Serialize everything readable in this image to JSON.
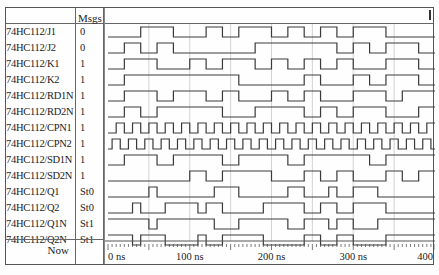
{
  "header": {
    "name_col": "",
    "msgs_col": "Msgs"
  },
  "signals": [
    {
      "name": "74HC112/J1",
      "value": "0",
      "init": 0,
      "toggles": [
        40,
        80,
        120,
        140,
        160,
        200,
        220,
        240,
        260,
        280,
        300,
        340
      ]
    },
    {
      "name": "74HC112/J2",
      "value": "0",
      "init": 0,
      "toggles": [
        20,
        40,
        60,
        80,
        180,
        280,
        300,
        320,
        340,
        380
      ]
    },
    {
      "name": "74HC112/K1",
      "value": "1",
      "init": 0,
      "toggles": [
        20,
        60,
        100,
        120,
        140,
        180,
        200,
        220,
        240,
        260,
        280,
        300,
        340,
        380
      ]
    },
    {
      "name": "74HC112/K2",
      "value": "1",
      "init": 0,
      "toggles": [
        20,
        160,
        240,
        260,
        300,
        320,
        340,
        380
      ]
    },
    {
      "name": "74HC112/RD1N",
      "value": "1",
      "init": 0,
      "toggles": [
        20,
        60,
        80,
        120,
        140,
        160,
        200,
        220,
        240,
        260,
        300,
        340,
        360
      ]
    },
    {
      "name": "74HC112/RD2N",
      "value": "1",
      "init": 0,
      "toggles": [
        20,
        40,
        60,
        140,
        180,
        240,
        260,
        280,
        300,
        340,
        380
      ]
    },
    {
      "name": "74HC112/CPN1",
      "value": "1",
      "init": 0,
      "clock": {
        "period": 20,
        "offset": 10
      }
    },
    {
      "name": "74HC112/CPN2",
      "value": "1",
      "init": 0,
      "clock": {
        "period": 20,
        "offset": 5
      }
    },
    {
      "name": "74HC112/SD1N",
      "value": "1",
      "init": 0,
      "toggles": [
        20,
        60,
        80,
        140,
        160,
        220,
        240,
        320,
        340
      ]
    },
    {
      "name": "74HC112/SD2N",
      "value": "1",
      "init": 0,
      "toggles": [
        100,
        120,
        140,
        200,
        240,
        260,
        280,
        300,
        340,
        360,
        380
      ]
    },
    {
      "name": "74HC112/Q1",
      "value": "St0",
      "init": 0,
      "toggles": [
        50,
        60,
        130,
        160,
        220,
        240,
        270,
        280,
        300,
        330
      ]
    },
    {
      "name": "74HC112/Q2",
      "value": "St0",
      "init": 0,
      "toggles": [
        30,
        40,
        70,
        110,
        120,
        140,
        190,
        240,
        260,
        280,
        300,
        340
      ]
    },
    {
      "name": "74HC112/Q1N",
      "value": "St1",
      "init": 1,
      "toggles": [
        50,
        60,
        130,
        160,
        220,
        240,
        270,
        280,
        300,
        330
      ]
    },
    {
      "name": "74HC112/Q2N",
      "value": "St1",
      "init": 1,
      "toggles": [
        30,
        40,
        70,
        110,
        120,
        140,
        190,
        240,
        260,
        280,
        300,
        340
      ]
    }
  ],
  "timeline": {
    "now_label": "Now",
    "start_ns": 0,
    "end_ns": 400,
    "major_ticks": [
      {
        "t": 0,
        "label": "0 ns"
      },
      {
        "t": 100,
        "label": "100 ns"
      },
      {
        "t": 200,
        "label": "200 ns"
      },
      {
        "t": 300,
        "label": "300 ns"
      },
      {
        "t": 400,
        "label": "400"
      }
    ],
    "grid_every_ns": 50
  },
  "colors": {
    "wave": "#3a3a3a",
    "grid": "#c8c8c8",
    "border": "#555555"
  }
}
